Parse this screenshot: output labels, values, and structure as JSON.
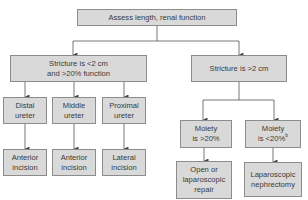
{
  "diagram": {
    "type": "flowchart",
    "root": {
      "id": "assess",
      "label": "Assess length, renal function"
    },
    "branches": {
      "short": {
        "id": "short-stricture",
        "lines": [
          "Stricture is <2 cm",
          "and >20% function"
        ],
        "children": [
          {
            "id": "distal",
            "lines": [
              "Distal",
              "ureter"
            ],
            "outcome": [
              "Anterior",
              "incision"
            ]
          },
          {
            "id": "middle",
            "lines": [
              "Middle",
              "ureter"
            ],
            "outcome": [
              "Anterior",
              "incision"
            ]
          },
          {
            "id": "proximal",
            "lines": [
              "Proximal",
              "ureter"
            ],
            "outcome": [
              "Lateral",
              "incision"
            ]
          }
        ]
      },
      "long": {
        "id": "long-stricture",
        "label": "Stricture is >2 cm",
        "children": [
          {
            "id": "moiety-high",
            "lines": [
              "Moiety",
              "is >20%"
            ],
            "outcome": [
              "Open or",
              "laparoscopic",
              "repair"
            ]
          },
          {
            "id": "moiety-low",
            "lines": [
              "Moiety",
              "is <20%"
            ],
            "superscript": "b",
            "outcome": [
              "Laparoscopic",
              "nephrectomy"
            ]
          }
        ]
      }
    },
    "colors": {
      "box_fill": "#d9d9d9",
      "box_border": "#8c8c8c",
      "line": "#555555",
      "text": "#3a3a3a"
    }
  }
}
